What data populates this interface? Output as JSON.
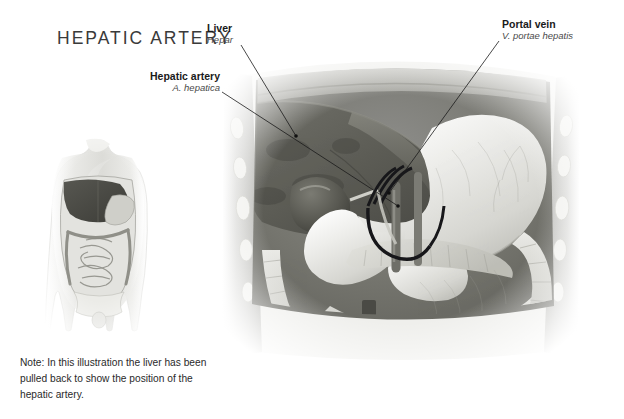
{
  "plate": {
    "title": "HEPATIC ARTERY",
    "background_color": "#ffffff",
    "ink_color": "#231f20"
  },
  "labels": [
    {
      "id": "liver",
      "english": "Liver",
      "latin": "Hepar",
      "align": "left",
      "text_x": 207,
      "text_y": 22,
      "leader": {
        "x1": 241,
        "y1": 45,
        "x2": 296,
        "y2": 136
      },
      "dot": {
        "x": 296,
        "y": 136
      }
    },
    {
      "id": "hepatic-artery",
      "english": "Hepatic artery",
      "latin": "A. hepatica",
      "align": "right",
      "text_x": 120,
      "text_y": 70,
      "leader": {
        "x1": 222,
        "y1": 92,
        "x2": 398,
        "y2": 206
      },
      "dot": {
        "x": 398,
        "y": 206
      }
    },
    {
      "id": "portal-vein",
      "english": "Portal vein",
      "latin": "V. portae hepatis",
      "align": "left",
      "text_x": 502,
      "text_y": 18,
      "leader": {
        "x1": 499,
        "y1": 41,
        "x2": 389,
        "y2": 193
      },
      "dot": {
        "x": 389,
        "y": 193
      }
    }
  ],
  "note": {
    "text": "Note: In this illustration the liver has been pulled back to show the position of the hepatic artery."
  },
  "orientation_figure": {
    "name": "human-torso-orientation-figure",
    "description": "Small grayscale anterior view of a human torso with the abdominal organs shown in place",
    "x": 48,
    "y": 138,
    "width": 104,
    "height": 200
  },
  "main_illustration": {
    "name": "abdominal-cavity-illustration",
    "description": "Grayscale anatomical illustration of the opened abdominal cavity showing the liver retracted, gallbladder, stomach, duodenum, pancreas, hepatic artery and portal vein, and the colon",
    "x": 216,
    "y": 58,
    "width": 368,
    "height": 300,
    "structures": [
      "liver",
      "gallbladder",
      "stomach",
      "duodenum",
      "pancreas",
      "hepatic artery",
      "portal vein",
      "transverse colon",
      "ascending colon",
      "descending colon",
      "body wall",
      "ribs",
      "diaphragm"
    ]
  }
}
